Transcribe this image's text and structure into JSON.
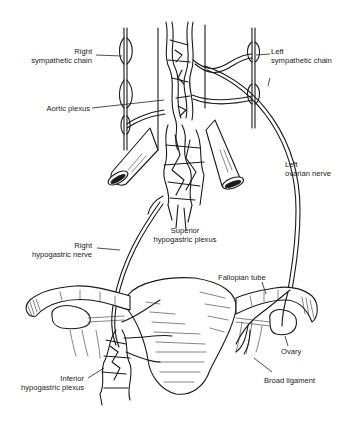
{
  "diagram": {
    "type": "anatomical line drawing",
    "colors": {
      "ink": "#1a1a1a",
      "background": "#ffffff"
    },
    "labels": {
      "right_sympathetic_chain": {
        "line1": "Right",
        "line2": "sympathetic chain"
      },
      "left_sympathetic_chain": {
        "line1": "Left",
        "line2": "sympathetic chain"
      },
      "aortic_plexus": {
        "line1": "Aortic plexus"
      },
      "left_ovarian_nerve": {
        "line1": "Left",
        "line2": "ovarian nerve"
      },
      "superior_hypogastric_plexus": {
        "line1": "Superior",
        "line2": "hypogastric plexus"
      },
      "right_hypogastric_nerve": {
        "line1": "Right",
        "line2": "hypogastric nerve"
      },
      "fallopian_tube": {
        "line1": "Fallopian tube"
      },
      "inferior_hypogastric_plexus": {
        "line1": "Inferior",
        "line2": "hypogastric plexus"
      },
      "ovary": {
        "line1": "Ovary"
      },
      "broad_ligament": {
        "line1": "Broad ligament"
      }
    }
  }
}
